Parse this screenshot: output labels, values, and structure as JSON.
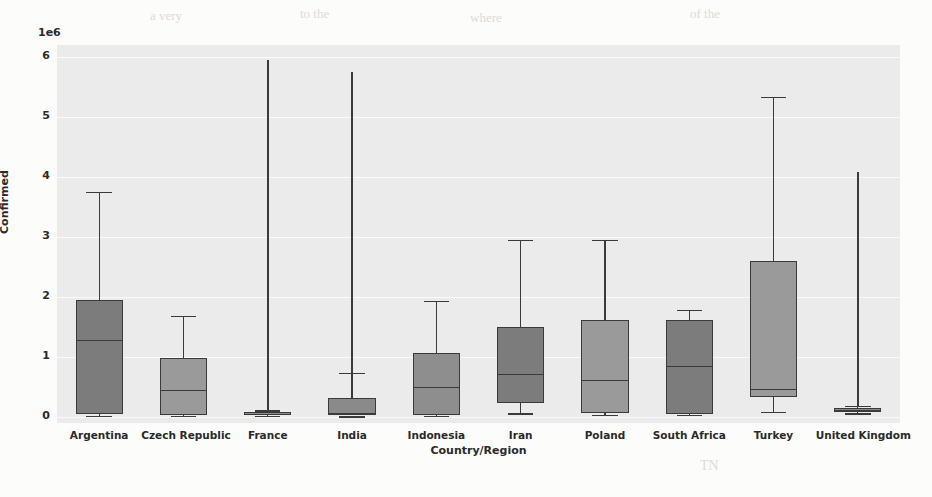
{
  "figure": {
    "background": "#fcfcfb",
    "plot_background": "#ebebeb",
    "grid_color": "#fafafa",
    "line_color": "#3a3a3a"
  },
  "ghost_text": [
    {
      "t": "a very",
      "x": 150,
      "y": 8,
      "s": 13
    },
    {
      "t": "to the",
      "x": 300,
      "y": 6,
      "s": 13
    },
    {
      "t": "where",
      "x": 470,
      "y": 10,
      "s": 13
    },
    {
      "t": "of the",
      "x": 690,
      "y": 6,
      "s": 13
    },
    {
      "t": "the number",
      "x": 60,
      "y": 70,
      "s": 15
    },
    {
      "t": "confirmed cases",
      "x": 210,
      "y": 66,
      "s": 15
    },
    {
      "t": "in the",
      "x": 430,
      "y": 72,
      "s": 15
    },
    {
      "t": "countries",
      "x": 560,
      "y": 66,
      "s": 15
    },
    {
      "t": "is a",
      "x": 740,
      "y": 70,
      "s": 15
    },
    {
      "t": "distribution",
      "x": 60,
      "y": 100,
      "s": 15
    },
    {
      "t": "of the data",
      "x": 240,
      "y": 104,
      "s": 15
    },
    {
      "t": "across the",
      "x": 430,
      "y": 98,
      "s": 15
    },
    {
      "t": "selected",
      "x": 640,
      "y": 104,
      "s": 15
    },
    {
      "t": "and a comparison of",
      "x": 90,
      "y": 132,
      "s": 15
    },
    {
      "t": "the spread",
      "x": 430,
      "y": 136,
      "s": 15
    },
    {
      "t": "between",
      "x": 620,
      "y": 130,
      "s": 15
    },
    {
      "t": "Conclusion",
      "x": 620,
      "y": 196,
      "s": 21
    },
    {
      "t": "it is",
      "x": 60,
      "y": 250,
      "s": 15
    },
    {
      "t": "observed that",
      "x": 160,
      "y": 246,
      "s": 15
    },
    {
      "t": "the outliers",
      "x": 390,
      "y": 252,
      "s": 15
    },
    {
      "t": "remain",
      "x": 620,
      "y": 246,
      "s": 15
    },
    {
      "t": "within",
      "x": 780,
      "y": 252,
      "s": 15
    },
    {
      "t": "a range",
      "x": 60,
      "y": 300,
      "s": 15
    },
    {
      "t": "of values",
      "x": 220,
      "y": 296,
      "s": 15
    },
    {
      "t": "that are",
      "x": 430,
      "y": 302,
      "s": 15
    },
    {
      "t": "consistent",
      "x": 620,
      "y": 296,
      "s": 15
    },
    {
      "t": "TN",
      "x": 700,
      "y": 458,
      "s": 14
    }
  ],
  "chart_data": {
    "type": "box",
    "title": "",
    "xlabel": "Country/Region",
    "ylabel": "Confirmed",
    "y_offset_label": "1e6",
    "y_offset": 1000000,
    "ylim": [
      -100000,
      6200000
    ],
    "yticks": [
      0,
      1,
      2,
      3,
      4,
      5,
      6
    ],
    "ytick_labels": [
      "0",
      "1",
      "2",
      "3",
      "4",
      "5",
      "6"
    ],
    "grid": true,
    "legend": null,
    "categories": [
      "Argentina",
      "Czech Republic",
      "France",
      "India",
      "Indonesia",
      "Iran",
      "Poland",
      "South Africa",
      "Turkey",
      "United Kingdom"
    ],
    "boxes": [
      {
        "category": "Argentina",
        "whisker_low": 20000,
        "q1": 50000,
        "median": 1280000,
        "q3": 1950000,
        "whisker_high": 3750000,
        "fliers_high": null,
        "color": "#7c7c7c"
      },
      {
        "category": "Czech Republic",
        "whisker_low": 25000,
        "q1": 30000,
        "median": 455000,
        "q3": 980000,
        "whisker_high": 1690000,
        "fliers_high": null,
        "color": "#9a9a9a"
      },
      {
        "category": "France",
        "whisker_low": 20000,
        "q1": 30000,
        "median": 50000,
        "q3": 80000,
        "whisker_high": 110000,
        "fliers_high": 5950000,
        "color": "#8a8a8a"
      },
      {
        "category": "India",
        "whisker_low": 10000,
        "q1": 25000,
        "median": 60000,
        "q3": 320000,
        "whisker_high": 730000,
        "fliers_high": 5750000,
        "color": "#8a8a8a"
      },
      {
        "category": "Indonesia",
        "whisker_low": 25000,
        "q1": 40000,
        "median": 500000,
        "q3": 1070000,
        "whisker_high": 1930000,
        "fliers_high": null,
        "color": "#8e8e8e"
      },
      {
        "category": "Iran",
        "whisker_low": 60000,
        "q1": 230000,
        "median": 720000,
        "q3": 1500000,
        "whisker_high": 2950000,
        "fliers_high": null,
        "color": "#7c7c7c"
      },
      {
        "category": "Poland",
        "whisker_low": 30000,
        "q1": 60000,
        "median": 620000,
        "q3": 1620000,
        "whisker_high": 2950000,
        "fliers_high": null,
        "color": "#9a9a9a"
      },
      {
        "category": "South Africa",
        "whisker_low": 40000,
        "q1": 50000,
        "median": 855000,
        "q3": 1620000,
        "whisker_high": 1780000,
        "fliers_high": null,
        "color": "#7c7c7c"
      },
      {
        "category": "Turkey",
        "whisker_low": 90000,
        "q1": 330000,
        "median": 470000,
        "q3": 2600000,
        "whisker_high": 5330000,
        "fliers_high": null,
        "color": "#9a9a9a"
      },
      {
        "category": "United Kingdom",
        "whisker_low": 60000,
        "q1": 90000,
        "median": 120000,
        "q3": 150000,
        "whisker_high": 185000,
        "fliers_high": 4080000,
        "color": "#8a8a8a"
      }
    ]
  }
}
